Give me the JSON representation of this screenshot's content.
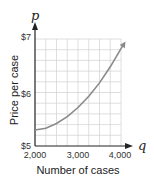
{
  "chart_data": {
    "type": "line",
    "title": "",
    "xlabel": "Number of cases",
    "ylabel": "Price per case",
    "x_var": "q",
    "y_var": "p",
    "xlim": [
      2000,
      4100
    ],
    "ylim": [
      5,
      7
    ],
    "x_ticks": [
      2000,
      3000,
      4000
    ],
    "x_tick_labels": [
      "2,000",
      "3,000",
      "4,000"
    ],
    "y_ticks": [
      5,
      6,
      7
    ],
    "y_tick_labels": [
      "$5",
      "$6",
      "$7"
    ],
    "grid": true,
    "legend": "none",
    "series": [
      {
        "name": "price curve",
        "color": "#8a8a8a",
        "x": [
          2000,
          2250,
          2500,
          2750,
          3000,
          3250,
          3500,
          3750,
          4000,
          4080
        ],
        "y": [
          5.3,
          5.33,
          5.42,
          5.55,
          5.72,
          5.93,
          6.18,
          6.48,
          6.82,
          6.92
        ]
      }
    ]
  },
  "labels": {
    "y_var": "p",
    "x_var": "q",
    "ylabel": "Price per case",
    "xlabel": "Number of cases",
    "y7": "$7",
    "y6": "$6",
    "y5": "$5",
    "x2000": "2,000",
    "x3000": "3,000",
    "x4000": "4,000"
  }
}
